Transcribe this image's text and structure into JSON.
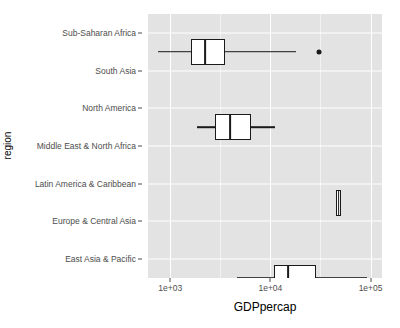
{
  "chart_data": {
    "type": "box",
    "title": "",
    "xlabel": "GDPpercap",
    "ylabel": "region",
    "x_scale": "log10",
    "xlim": [
      600,
      130000
    ],
    "grid": true,
    "legend": "none",
    "x_ticks": [
      {
        "value": 1000,
        "label": "1e+03"
      },
      {
        "value": 10000,
        "label": "1e+04"
      },
      {
        "value": 100000,
        "label": "1e+05"
      }
    ],
    "x_minor_ticks": [
      3162,
      31623
    ],
    "categories": [
      "Sub-Saharan Africa",
      "South Asia",
      "North America",
      "Middle East & North Africa",
      "Latin America & Caribbean",
      "Europe & Central Asia",
      "East Asia & Pacific"
    ],
    "boxes": [
      {
        "category": "Sub-Saharan Africa",
        "lower_whisker": 760,
        "q1": 1620,
        "median": 2240,
        "q3": 3500,
        "upper_whisker": 18200,
        "outliers": [
          30800
        ]
      },
      {
        "category": "South Asia",
        "lower_whisker": 1870,
        "q1": 2820,
        "median": 3980,
        "q3": 6400,
        "upper_whisker": 11200,
        "outliers": []
      },
      {
        "category": "North America",
        "lower_whisker": 45000,
        "q1": 45000,
        "median": 48000,
        "q3": 51000,
        "upper_whisker": 51000,
        "outliers": []
      },
      {
        "category": "Middle East & North Africa",
        "lower_whisker": 4680,
        "q1": 10900,
        "median": 14900,
        "q3": 28800,
        "upper_whisker": 93000,
        "outliers": []
      },
      {
        "category": "Latin America & Caribbean",
        "lower_whisker": 4680,
        "q1": 10200,
        "median": 12400,
        "q3": 17100,
        "upper_whisker": 24500,
        "outliers": [
          1290,
          42000
        ]
      },
      {
        "category": "Europe & Central Asia",
        "lower_whisker": 4900,
        "q1": 14000,
        "median": 18400,
        "q3": 26500,
        "upper_whisker": 48000,
        "outliers": [
          1810,
          2350
        ]
      },
      {
        "category": "East Asia & Pacific",
        "lower_whisker": 2060,
        "q1": 3250,
        "median": 5400,
        "q3": 16200,
        "upper_whisker": 48000,
        "outliers": []
      }
    ]
  },
  "axes": {
    "x_title": "GDPpercap",
    "y_title": "region"
  },
  "colors": {
    "panel_background": "#e3e3e3",
    "gridline_major": "#ffffff",
    "gridline_minor": "#f2f2f2",
    "box_stroke": "#1a1a1a",
    "box_fill": "#ffffff",
    "tick_label": "#4d4d4d",
    "axis_title": "#000000",
    "page_background": "#ffffff"
  }
}
